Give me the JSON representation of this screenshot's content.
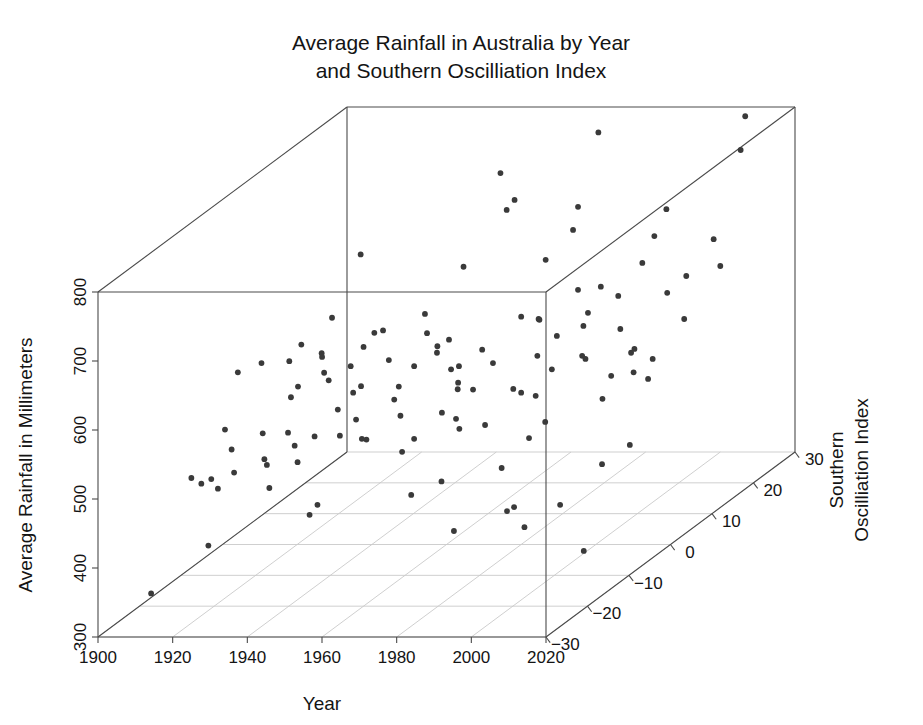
{
  "chart_data": {
    "type": "scatter",
    "title": "Average Rainfall in Australia by Year and Southern Oscilliation Index",
    "title_line1": "Average Rainfall in Australia by Year",
    "title_line2": "and Southern Oscilliation Index",
    "projection": "3d",
    "grid": true,
    "legend": "none",
    "xlabel": "Year",
    "ylabel": "Average Rainfall in Millimeters",
    "zlabel": "Southern Oscilliation Index",
    "zlabel_line1": "Southern",
    "zlabel_line2": "Oscilliation Index",
    "xlim": [
      1900,
      2020
    ],
    "ylim": [
      300,
      800
    ],
    "zlim": [
      -30,
      30
    ],
    "xticks": [
      1900,
      1920,
      1940,
      1960,
      1980,
      2000,
      2020
    ],
    "yticks": [
      300,
      400,
      500,
      600,
      700,
      800
    ],
    "zticks": [
      -30,
      -20,
      -10,
      0,
      10,
      20,
      30
    ],
    "xtick_labels": [
      "1900",
      "1920",
      "1940",
      "1960",
      "1980",
      "2000",
      "2020"
    ],
    "ytick_labels": [
      "300",
      "400",
      "500",
      "600",
      "700",
      "800"
    ],
    "ztick_labels": [
      "−30",
      "−20",
      "−10",
      "0",
      "10",
      "20",
      "30"
    ],
    "point_color": "#3a3a3a",
    "point_radius": 2.9,
    "series_name": "rainfall-soi",
    "points": [
      [
        1901,
        415,
        -6
      ],
      [
        1902,
        314,
        -19
      ],
      [
        1903,
        545,
        1
      ],
      [
        1904,
        480,
        -3
      ],
      [
        1905,
        450,
        -12
      ],
      [
        1906,
        545,
        4
      ],
      [
        1907,
        435,
        -9
      ],
      [
        1908,
        460,
        -5
      ],
      [
        1909,
        530,
        8
      ],
      [
        1910,
        545,
        10
      ],
      [
        1911,
        430,
        -11
      ],
      [
        1912,
        440,
        -8
      ],
      [
        1913,
        470,
        -2
      ],
      [
        1914,
        370,
        -16
      ],
      [
        1915,
        500,
        3
      ],
      [
        1916,
        575,
        12
      ],
      [
        1917,
        640,
        18
      ],
      [
        1918,
        520,
        2
      ],
      [
        1919,
        455,
        -7
      ],
      [
        1920,
        545,
        6
      ],
      [
        1921,
        555,
        5
      ],
      [
        1922,
        480,
        -4
      ],
      [
        1923,
        460,
        -10
      ],
      [
        1924,
        520,
        4
      ],
      [
        1925,
        540,
        2
      ],
      [
        1926,
        470,
        -6
      ],
      [
        1927,
        440,
        -13
      ],
      [
        1928,
        470,
        -3
      ],
      [
        1929,
        455,
        -8
      ],
      [
        1930,
        555,
        7
      ],
      [
        1931,
        545,
        3
      ],
      [
        1932,
        500,
        -1
      ],
      [
        1933,
        570,
        9
      ],
      [
        1934,
        580,
        6
      ],
      [
        1935,
        520,
        0
      ],
      [
        1936,
        525,
        1
      ],
      [
        1937,
        480,
        -5
      ],
      [
        1938,
        490,
        -2
      ],
      [
        1939,
        545,
        5
      ],
      [
        1940,
        410,
        -15
      ],
      [
        1941,
        420,
        -14
      ],
      [
        1942,
        585,
        11
      ],
      [
        1943,
        470,
        -4
      ],
      [
        1944,
        480,
        -6
      ],
      [
        1945,
        520,
        2
      ],
      [
        1946,
        510,
        0
      ],
      [
        1947,
        575,
        7
      ],
      [
        1948,
        545,
        3
      ],
      [
        1949,
        640,
        14
      ],
      [
        1950,
        740,
        22
      ],
      [
        1951,
        500,
        -3
      ],
      [
        1952,
        565,
        5
      ],
      [
        1953,
        560,
        4
      ],
      [
        1954,
        570,
        6
      ],
      [
        1955,
        700,
        19
      ],
      [
        1956,
        710,
        20
      ],
      [
        1957,
        470,
        -8
      ],
      [
        1958,
        480,
        -6
      ],
      [
        1959,
        545,
        2
      ],
      [
        1960,
        545,
        3
      ],
      [
        1961,
        500,
        -2
      ],
      [
        1962,
        530,
        1
      ],
      [
        1963,
        525,
        0
      ],
      [
        1964,
        560,
        5
      ],
      [
        1965,
        430,
        -13
      ],
      [
        1966,
        520,
        1
      ],
      [
        1967,
        500,
        -4
      ],
      [
        1968,
        545,
        4
      ],
      [
        1969,
        490,
        -5
      ],
      [
        1970,
        590,
        9
      ],
      [
        1971,
        650,
        14
      ],
      [
        1972,
        445,
        -12
      ],
      [
        1973,
        700,
        20
      ],
      [
        1974,
        790,
        24
      ],
      [
        1975,
        680,
        17
      ],
      [
        1976,
        590,
        8
      ],
      [
        1977,
        500,
        -6
      ],
      [
        1978,
        600,
        6
      ],
      [
        1979,
        530,
        -1
      ],
      [
        1980,
        520,
        0
      ],
      [
        1981,
        560,
        3
      ],
      [
        1982,
        400,
        -18
      ],
      [
        1983,
        620,
        11
      ],
      [
        1984,
        580,
        5
      ],
      [
        1985,
        520,
        -1
      ],
      [
        1986,
        545,
        2
      ],
      [
        1987,
        460,
        -11
      ],
      [
        1988,
        620,
        12
      ],
      [
        1989,
        600,
        8
      ],
      [
        1990,
        590,
        6
      ],
      [
        1991,
        490,
        -8
      ],
      [
        1992,
        500,
        -5
      ],
      [
        1993,
        560,
        3
      ],
      [
        1994,
        420,
        -16
      ],
      [
        1995,
        560,
        2
      ],
      [
        1996,
        620,
        9
      ],
      [
        1997,
        430,
        -17
      ],
      [
        1998,
        650,
        13
      ],
      [
        1999,
        680,
        15
      ],
      [
        2000,
        710,
        17
      ],
      [
        2001,
        590,
        5
      ],
      [
        2002,
        410,
        -19
      ],
      [
        2003,
        540,
        1
      ],
      [
        2004,
        520,
        -2
      ],
      [
        2005,
        560,
        4
      ],
      [
        2006,
        420,
        -14
      ],
      [
        2007,
        570,
        3
      ],
      [
        2008,
        620,
        10
      ],
      [
        2009,
        545,
        1
      ],
      [
        2010,
        800,
        27
      ],
      [
        2011,
        760,
        25
      ],
      [
        2012,
        640,
        11
      ],
      [
        2013,
        560,
        2
      ],
      [
        2014,
        540,
        0
      ],
      [
        2015,
        470,
        -12
      ],
      [
        2016,
        680,
        14
      ],
      [
        2017,
        600,
        6
      ],
      [
        2018,
        480,
        -8
      ],
      [
        2019,
        380,
        -20
      ],
      [
        2020,
        650,
        12
      ]
    ]
  }
}
